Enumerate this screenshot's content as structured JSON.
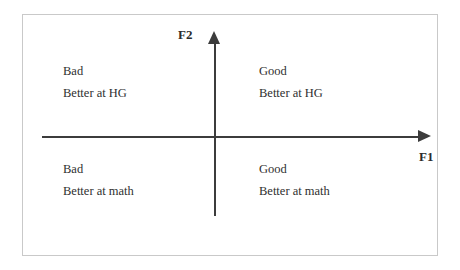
{
  "diagram": {
    "type": "quadrant-chart",
    "background_color": "#ffffff",
    "frame_color": "#c9c9c9",
    "axis_color": "#3c3c3c",
    "text_color": "#2f2f2f",
    "axes": {
      "x": {
        "label": "F1",
        "arrow": "right"
      },
      "y": {
        "label": "F2",
        "arrow": "up"
      }
    },
    "quadrants": [
      {
        "position": "top-left",
        "name": "quadrant-top-left",
        "line1": "Bad",
        "line2": "Better at HG"
      },
      {
        "position": "top-right",
        "name": "quadrant-top-right",
        "line1": "Good",
        "line2": "Better at HG"
      },
      {
        "position": "bottom-left",
        "name": "quadrant-bottom-left",
        "line1": "Bad",
        "line2": "Better at math"
      },
      {
        "position": "bottom-right",
        "name": "quadrant-bottom-right",
        "line1": "Good",
        "line2": "Better at math"
      }
    ]
  }
}
